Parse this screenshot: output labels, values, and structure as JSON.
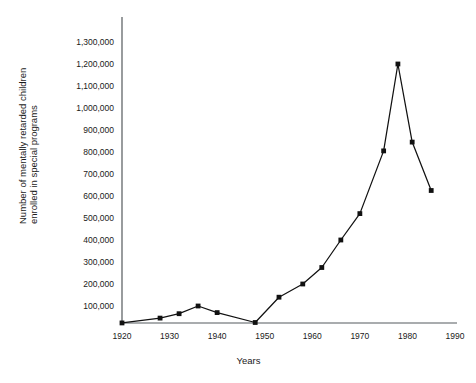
{
  "chart_data": {
    "type": "line",
    "title": "",
    "xlabel": "Years",
    "ylabel": "Number of mentally retarded children enrolled in special programs",
    "ylabel_line1": "Number of mentally retarded children",
    "ylabel_line2": "enrolled in special programs",
    "xlim": [
      1920,
      1990
    ],
    "ylim": [
      0,
      1300000
    ],
    "xticks": [
      1920,
      1930,
      1940,
      1950,
      1960,
      1970,
      1980,
      1990
    ],
    "xtick_labels": [
      "1920",
      "1930",
      "1940",
      "1950",
      "1960",
      "1970",
      "1980",
      "1990"
    ],
    "yticks": [
      100000,
      200000,
      300000,
      400000,
      500000,
      600000,
      700000,
      800000,
      900000,
      1000000,
      1100000,
      1200000,
      1300000
    ],
    "ytick_labels": [
      "100,000",
      "200,000",
      "300,000",
      "400,000",
      "500,000",
      "600,000",
      "700,000",
      "800,000",
      "900,000",
      "1,000,000",
      "1,100,000",
      "1,200,000",
      "1,300,000"
    ],
    "grid": false,
    "legend": false,
    "marker": "filled-square",
    "series": [
      {
        "name": "Enrollment",
        "x": [
          1920,
          1928,
          1932,
          1936,
          1940,
          1948,
          1953,
          1958,
          1962,
          1966,
          1970,
          1975,
          1978,
          1981,
          1985
        ],
        "values": [
          23000,
          45000,
          65000,
          100000,
          70000,
          25000,
          140000,
          200000,
          275000,
          400000,
          520000,
          805000,
          1200000,
          845000,
          625000
        ]
      }
    ]
  },
  "axis": {
    "x_label": "Years",
    "y_label_line1": "Number of mentally retarded children",
    "y_label_line2": "enrolled in special programs"
  },
  "colors": {
    "line": "#111111",
    "axis": "#555a5e",
    "text": "#1a1a1a",
    "background": "#ffffff"
  }
}
